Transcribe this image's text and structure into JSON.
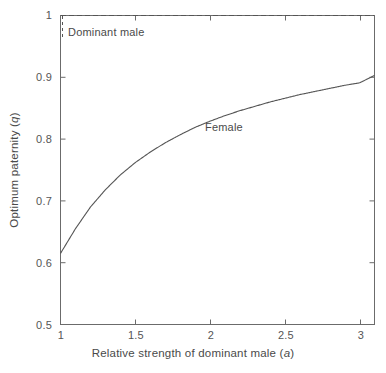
{
  "chart_data": {
    "type": "line",
    "title": "",
    "xlabel": "Relative strength of dominant male (a)",
    "ylabel": "Optimum paternity (q)",
    "xlim": [
      1,
      3.1
    ],
    "ylim": [
      0.5,
      1
    ],
    "xticks": [
      1,
      1.5,
      2,
      2.5,
      3
    ],
    "xtick_labels": [
      "1",
      "1.5",
      "2",
      "2.5",
      "3"
    ],
    "yticks": [
      0.5,
      0.6,
      0.7,
      0.8,
      0.9,
      1
    ],
    "ytick_labels": [
      "0.5",
      "0.6",
      "0.7",
      "0.8",
      "0.9",
      "1"
    ],
    "grid": false,
    "legend_position": "inline-annotations",
    "series": [
      {
        "name": "Dominant male",
        "style": "dashed",
        "color": "#555555",
        "annotation": "Dominant male",
        "x": [
          1,
          1.2,
          1.4,
          1.6,
          1.8,
          2,
          2.2,
          2.4,
          2.6,
          2.8,
          3,
          3.1
        ],
        "values": [
          1,
          1,
          1,
          1,
          1,
          1,
          1,
          1,
          1,
          1,
          1,
          1
        ]
      },
      {
        "name": "Female",
        "style": "solid",
        "color": "#555555",
        "annotation": "Female",
        "x": [
          1,
          1.1,
          1.2,
          1.3,
          1.4,
          1.5,
          1.6,
          1.7,
          1.8,
          1.9,
          2,
          2.1,
          2.2,
          2.3,
          2.4,
          2.5,
          2.6,
          2.7,
          2.8,
          2.9,
          3,
          3.1
        ],
        "values": [
          0.615,
          0.655,
          0.69,
          0.718,
          0.742,
          0.762,
          0.779,
          0.794,
          0.807,
          0.819,
          0.829,
          0.838,
          0.846,
          0.853,
          0.86,
          0.866,
          0.872,
          0.877,
          0.882,
          0.887,
          0.891,
          0.903
        ]
      }
    ]
  },
  "axes": {
    "x_title_main": "Relative strength of dominant male (",
    "x_title_italic": "a",
    "x_title_end": ")",
    "y_title_main": "Optimum paternity (",
    "y_title_italic": "q",
    "y_title_end": ")"
  },
  "annotations": {
    "dominant_male": "Dominant male",
    "female": "Female"
  },
  "colors": {
    "axis": "#6b6b6b",
    "curve": "#555555",
    "text": "#4a4a4a",
    "background": "#ffffff"
  }
}
